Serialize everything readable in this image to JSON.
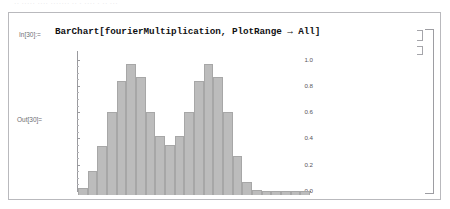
{
  "window": {
    "top_sliver_text": "·· ····· ···· ······· ·· · ···· · ·· ···",
    "app": "mathematica-notebook"
  },
  "cell": {
    "in_label": "In[30]:=",
    "out_label": "Out[30]=",
    "input_code": "BarChart[fourierMultiplication, PlotRange → All]"
  },
  "brackets": {
    "outer_name": "cell-group-bracket",
    "input_name": "input-cell-bracket",
    "output_name": "output-cell-bracket"
  },
  "colors": {
    "bar_fill": "#bcbcbc",
    "bar_edge": "#a7a7a7",
    "axis": "#8f8f93",
    "frame": "#b9b9bd",
    "label": "#6d6d72"
  },
  "chart_data": {
    "type": "bar",
    "title": "",
    "xlabel": "",
    "ylabel": "",
    "ylim": [
      0.0,
      1.05
    ],
    "grid": false,
    "legend": null,
    "ytick_labels": [
      "1.0",
      "0.8",
      "0.6",
      "0.4",
      "0.2",
      "0.0"
    ],
    "ytick_values": [
      1.0,
      0.8,
      0.6,
      0.4,
      0.2,
      0.0
    ],
    "xtick_labels": [],
    "categories": [
      1,
      2,
      3,
      4,
      5,
      6,
      7,
      8,
      9,
      10,
      11,
      12,
      13,
      14,
      15,
      16,
      17,
      18,
      19,
      20,
      21,
      22,
      23,
      24
    ],
    "values": [
      0.05,
      0.18,
      0.37,
      0.63,
      0.87,
      1.0,
      0.9,
      0.63,
      0.45,
      0.38,
      0.45,
      0.63,
      0.87,
      1.0,
      0.9,
      0.63,
      0.3,
      0.1,
      0.04,
      0.03,
      0.03,
      0.03,
      0.03,
      0.03
    ]
  }
}
